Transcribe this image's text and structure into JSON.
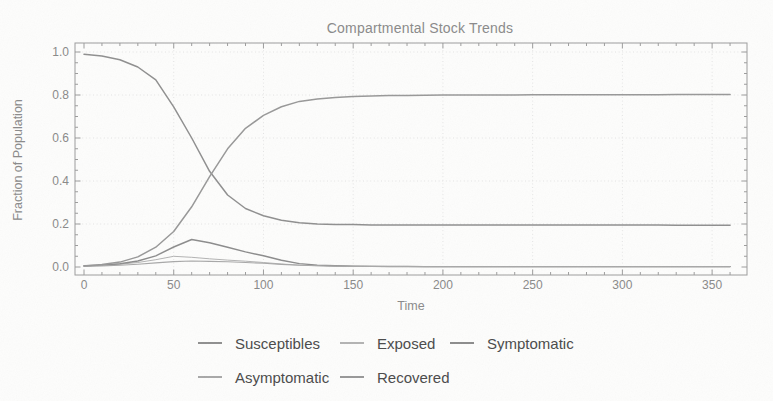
{
  "title": "Compartmental Stock Trends",
  "colors": {
    "frame": "#9c9c9c",
    "grid": "#e4e4e4",
    "tick_text": "#898989",
    "title_text": "#8a8a8a",
    "legend_text": "#4a4a4a",
    "background": "#fdfdfc"
  },
  "chart_data": {
    "type": "line",
    "title": "Compartmental Stock Trends",
    "xlabel": "Time",
    "ylabel": "Fraction of Population",
    "xlim": [
      0,
      370
    ],
    "ylim": [
      -0.04,
      1.04
    ],
    "grid": true,
    "grid_style": "dotted",
    "legend_position": "below-two-rows",
    "x_ticks": [
      0,
      50,
      100,
      150,
      200,
      250,
      300,
      350
    ],
    "x_minor_step": 10,
    "y_ticks": [
      0,
      0.2,
      0.4,
      0.6,
      0.8,
      1.0
    ],
    "y_tick_labels": [
      "0.0",
      "0.2",
      "0.4",
      "0.6",
      "0.8",
      "1.0"
    ],
    "y_minor_step": 0.05,
    "x": [
      0,
      10,
      20,
      30,
      40,
      50,
      60,
      70,
      80,
      90,
      100,
      110,
      120,
      130,
      140,
      150,
      160,
      170,
      180,
      190,
      200,
      210,
      220,
      230,
      240,
      250,
      260,
      270,
      280,
      290,
      300,
      310,
      320,
      330,
      340,
      350,
      360
    ],
    "series": [
      {
        "name": "Susceptibles",
        "color": "#8f8f8f",
        "values": [
          0.99,
          0.982,
          0.964,
          0.93,
          0.87,
          0.745,
          0.6,
          0.445,
          0.335,
          0.272,
          0.238,
          0.217,
          0.206,
          0.2,
          0.198,
          0.197,
          0.196,
          0.196,
          0.196,
          0.195,
          0.195,
          0.195,
          0.195,
          0.195,
          0.195,
          0.195,
          0.195,
          0.195,
          0.195,
          0.195,
          0.195,
          0.195,
          0.195,
          0.194,
          0.194,
          0.194,
          0.194
        ]
      },
      {
        "name": "Exposed",
        "color": "#b3b3b3",
        "values": [
          0.005,
          0.008,
          0.013,
          0.021,
          0.034,
          0.05,
          0.045,
          0.038,
          0.032,
          0.027,
          0.021,
          0.014,
          0.009,
          0.006,
          0.004,
          0.003,
          0.003,
          0.002,
          0.002,
          0.002,
          0.002,
          0.002,
          0.002,
          0.002,
          0.002,
          0.002,
          0.002,
          0.002,
          0.002,
          0.002,
          0.002,
          0.002,
          0.002,
          0.002,
          0.002,
          0.002,
          0.002
        ]
      },
      {
        "name": "Symptomatic",
        "color": "#8c8c8c",
        "values": [
          0.006,
          0.009,
          0.015,
          0.028,
          0.052,
          0.093,
          0.128,
          0.113,
          0.092,
          0.07,
          0.052,
          0.031,
          0.016,
          0.009,
          0.006,
          0.004,
          0.003,
          0.003,
          0.003,
          0.002,
          0.002,
          0.002,
          0.002,
          0.002,
          0.002,
          0.002,
          0.002,
          0.002,
          0.002,
          0.002,
          0.002,
          0.002,
          0.002,
          0.002,
          0.002,
          0.002,
          0.002
        ]
      },
      {
        "name": "Asymptomatic",
        "color": "#a8a8a8",
        "values": [
          0.003,
          0.005,
          0.008,
          0.013,
          0.019,
          0.025,
          0.028,
          0.026,
          0.024,
          0.021,
          0.017,
          0.012,
          0.008,
          0.006,
          0.004,
          0.003,
          0.003,
          0.002,
          0.002,
          0.002,
          0.002,
          0.002,
          0.002,
          0.002,
          0.002,
          0.002,
          0.002,
          0.002,
          0.002,
          0.002,
          0.002,
          0.002,
          0.002,
          0.002,
          0.002,
          0.002,
          0.002
        ]
      },
      {
        "name": "Recovered",
        "color": "#989898",
        "values": [
          0.005,
          0.011,
          0.023,
          0.047,
          0.092,
          0.165,
          0.28,
          0.42,
          0.55,
          0.645,
          0.705,
          0.745,
          0.77,
          0.782,
          0.789,
          0.793,
          0.795,
          0.797,
          0.798,
          0.799,
          0.8,
          0.8,
          0.8,
          0.8,
          0.8,
          0.801,
          0.801,
          0.801,
          0.801,
          0.801,
          0.801,
          0.801,
          0.801,
          0.802,
          0.802,
          0.802,
          0.802
        ]
      }
    ]
  }
}
